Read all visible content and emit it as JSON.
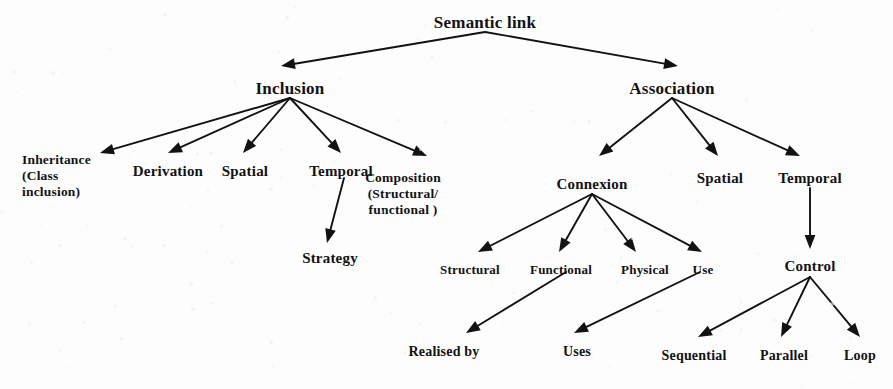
{
  "diagram": {
    "title_text": "Semantic link",
    "background_color": "#fdfdfd",
    "ink_color": "#121212",
    "nodes": {
      "root": {
        "label": "Semantic link",
        "x": 485,
        "y": 13
      },
      "inclusion": {
        "label": "Inclusion",
        "x": 290,
        "y": 79
      },
      "association": {
        "label": "Association",
        "x": 672,
        "y": 79
      },
      "inheritance": {
        "label": "Inheritance\n(Class\ninclusion)",
        "x": 22,
        "y": 152
      },
      "derivation": {
        "label": "Derivation",
        "x": 168,
        "y": 163
      },
      "spatial_inclusion": {
        "label": "Spatial",
        "x": 245,
        "y": 163
      },
      "temporal_inclusion": {
        "label": "Temporal",
        "x": 341,
        "y": 163
      },
      "composition": {
        "label": "Composition\n(Structural/\nfunctional )",
        "x": 403,
        "y": 170
      },
      "strategy": {
        "label": "Strategy",
        "x": 330,
        "y": 250
      },
      "connexion": {
        "label": "Connexion",
        "x": 592,
        "y": 176
      },
      "spatial_association": {
        "label": "Spatial",
        "x": 720,
        "y": 170
      },
      "temporal_association": {
        "label": "Temporal",
        "x": 810,
        "y": 170
      },
      "structural": {
        "label": "Structural",
        "x": 470,
        "y": 262
      },
      "functional": {
        "label": "Functional",
        "x": 561,
        "y": 262
      },
      "physical": {
        "label": "Physical",
        "x": 645,
        "y": 262
      },
      "use": {
        "label": "Use",
        "x": 703,
        "y": 262
      },
      "control": {
        "label": "Control",
        "x": 810,
        "y": 258
      },
      "realised_by": {
        "label": "Realised by",
        "x": 444,
        "y": 344
      },
      "uses": {
        "label": "Uses",
        "x": 577,
        "y": 344
      },
      "sequential": {
        "label": "Sequential",
        "x": 694,
        "y": 348
      },
      "parallel": {
        "label": "Parallel",
        "x": 784,
        "y": 348
      },
      "loop": {
        "label": "Loop",
        "x": 860,
        "y": 348
      }
    },
    "edges": [
      {
        "from": "root",
        "to": "inclusion",
        "x1": 485,
        "y1": 32,
        "x2": 281,
        "y2": 66
      },
      {
        "from": "root",
        "to": "association",
        "x1": 485,
        "y1": 32,
        "x2": 678,
        "y2": 66
      },
      {
        "from": "inclusion",
        "to": "inheritance",
        "x1": 290,
        "y1": 98,
        "x2": 100,
        "y2": 153
      },
      {
        "from": "inclusion",
        "to": "derivation",
        "x1": 290,
        "y1": 98,
        "x2": 168,
        "y2": 153
      },
      {
        "from": "inclusion",
        "to": "spatial_inclusion",
        "x1": 290,
        "y1": 98,
        "x2": 243,
        "y2": 153
      },
      {
        "from": "inclusion",
        "to": "temporal_inclusion",
        "x1": 290,
        "y1": 98,
        "x2": 341,
        "y2": 153
      },
      {
        "from": "inclusion",
        "to": "composition",
        "x1": 290,
        "y1": 98,
        "x2": 427,
        "y2": 156
      },
      {
        "from": "temporal_inclusion",
        "to": "strategy",
        "x1": 344,
        "y1": 178,
        "x2": 327,
        "y2": 243
      },
      {
        "from": "association",
        "to": "connexion",
        "x1": 672,
        "y1": 98,
        "x2": 599,
        "y2": 156
      },
      {
        "from": "association",
        "to": "spatial_association",
        "x1": 672,
        "y1": 98,
        "x2": 718,
        "y2": 156
      },
      {
        "from": "association",
        "to": "temporal_association",
        "x1": 672,
        "y1": 98,
        "x2": 800,
        "y2": 156
      },
      {
        "from": "connexion",
        "to": "structural",
        "x1": 592,
        "y1": 194,
        "x2": 478,
        "y2": 252
      },
      {
        "from": "connexion",
        "to": "functional",
        "x1": 592,
        "y1": 194,
        "x2": 559,
        "y2": 252
      },
      {
        "from": "connexion",
        "to": "physical",
        "x1": 592,
        "y1": 194,
        "x2": 636,
        "y2": 252
      },
      {
        "from": "connexion",
        "to": "use",
        "x1": 592,
        "y1": 194,
        "x2": 702,
        "y2": 252
      },
      {
        "from": "temporal_association",
        "to": "control",
        "x1": 810,
        "y1": 188,
        "x2": 810,
        "y2": 249
      },
      {
        "from": "functional",
        "to": "realised_by",
        "x1": 566,
        "y1": 272,
        "x2": 466,
        "y2": 333
      },
      {
        "from": "use",
        "to": "uses",
        "x1": 700,
        "y1": 272,
        "x2": 574,
        "y2": 333
      },
      {
        "from": "control",
        "to": "sequential",
        "x1": 810,
        "y1": 277,
        "x2": 698,
        "y2": 337
      },
      {
        "from": "control",
        "to": "parallel",
        "x1": 810,
        "y1": 277,
        "x2": 781,
        "y2": 337
      },
      {
        "from": "control",
        "to": "loop",
        "x1": 810,
        "y1": 277,
        "x2": 860,
        "y2": 337
      }
    ]
  }
}
